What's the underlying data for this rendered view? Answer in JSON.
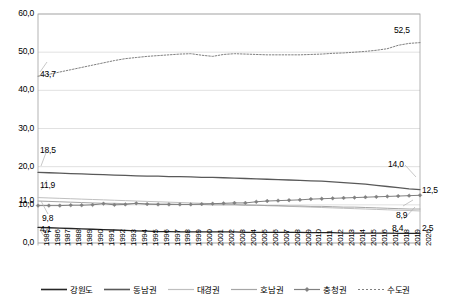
{
  "chart_data": {
    "type": "line",
    "title": "",
    "xlabel": "",
    "ylabel": "",
    "ylim": [
      0.0,
      60.0
    ],
    "yticks": [
      "0,0",
      "10,0",
      "20,0",
      "30,0",
      "40,0",
      "50,0",
      "60,0"
    ],
    "ytick_values": [
      0.0,
      10.0,
      20.0,
      30.0,
      40.0,
      50.0,
      60.0
    ],
    "extra_ytick": {
      "label": "11,0",
      "value": 11.0
    },
    "grid": "horizontal",
    "legend_position": "bottom",
    "x": [
      1985,
      1986,
      1987,
      1988,
      1989,
      1990,
      1991,
      1992,
      1993,
      1994,
      1995,
      1996,
      1997,
      1998,
      1999,
      2000,
      2001,
      2002,
      2003,
      2004,
      2005,
      2006,
      2007,
      2008,
      2009,
      2010,
      2011,
      2012,
      2013,
      2014,
      2015,
      2016,
      2017,
      2018,
      2019,
      2020
    ],
    "categories": [
      "1985",
      "1986",
      "1987",
      "1988",
      "1989",
      "1990",
      "1991",
      "1992",
      "1993",
      "1994",
      "1995",
      "1996",
      "1997",
      "1998",
      "1999",
      "2000",
      "2001",
      "2002",
      "2003",
      "2004",
      "2005",
      "2006",
      "2007",
      "2008",
      "2009",
      "2010",
      "2011",
      "2012",
      "2013",
      "2014",
      "2015",
      "2016",
      "2017",
      "2018",
      "2019",
      "2020"
    ],
    "series": [
      {
        "name": "수도권",
        "color": "#808080",
        "style": "dotted",
        "width": 1.0,
        "marker": "none",
        "values": [
          43.7,
          44.2,
          44.8,
          45.4,
          46.0,
          46.6,
          47.2,
          47.8,
          48.3,
          48.6,
          48.9,
          49.1,
          49.3,
          49.5,
          49.6,
          49.2,
          48.9,
          49.4,
          49.6,
          49.5,
          49.4,
          49.3,
          49.3,
          49.3,
          49.3,
          49.4,
          49.5,
          49.7,
          49.8,
          50.0,
          50.2,
          50.5,
          50.9,
          51.8,
          52.3,
          52.5
        ],
        "start_label": "43,7",
        "end_label": "52,5"
      },
      {
        "name": "동남권",
        "color": "#595959",
        "style": "solid",
        "width": 1.3,
        "marker": "none",
        "values": [
          18.5,
          18.4,
          18.3,
          18.2,
          18.1,
          18.0,
          17.9,
          17.8,
          17.7,
          17.6,
          17.5,
          17.5,
          17.4,
          17.4,
          17.3,
          17.2,
          17.2,
          17.1,
          17.0,
          16.9,
          16.8,
          16.7,
          16.6,
          16.5,
          16.4,
          16.3,
          16.2,
          16.0,
          15.8,
          15.6,
          15.4,
          15.1,
          14.8,
          14.5,
          14.2,
          14.0
        ],
        "start_label": "18,5",
        "end_label": "14,0"
      },
      {
        "name": "대경권",
        "color": "#bfbfbf",
        "style": "solid",
        "width": 1.0,
        "marker": "none",
        "values": [
          11.9,
          11.8,
          11.7,
          11.6,
          11.5,
          11.4,
          11.3,
          11.2,
          11.1,
          11.0,
          10.9,
          10.8,
          10.7,
          10.6,
          10.5,
          10.4,
          10.3,
          10.2,
          10.1,
          10.0,
          9.9,
          9.8,
          9.7,
          9.6,
          9.5,
          9.4,
          9.3,
          9.2,
          9.1,
          9.0,
          8.9,
          8.8,
          8.7,
          8.6,
          8.5,
          8.4
        ],
        "start_label": "11,9",
        "end_label": "8,4"
      },
      {
        "name": "호남권",
        "color": "#a6a6a6",
        "style": "solid",
        "width": 1.0,
        "marker": "none",
        "values": [
          11.0,
          10.9,
          10.8,
          10.7,
          10.6,
          10.5,
          10.4,
          10.4,
          10.3,
          10.3,
          10.2,
          10.2,
          10.2,
          10.1,
          10.1,
          10.1,
          10.0,
          10.0,
          10.0,
          9.9,
          9.9,
          9.8,
          9.8,
          9.7,
          9.7,
          9.6,
          9.6,
          9.5,
          9.4,
          9.4,
          9.3,
          9.2,
          9.1,
          9.0,
          8.9,
          8.9
        ],
        "start_label": "11,0",
        "end_label": "8,9"
      },
      {
        "name": "충청권",
        "color": "#808080",
        "style": "solid",
        "width": 1.0,
        "marker": "diamond",
        "values": [
          9.8,
          9.8,
          9.8,
          9.9,
          9.9,
          10.0,
          10.3,
          10.0,
          10.1,
          10.4,
          10.2,
          10.1,
          10.1,
          10.1,
          10.1,
          10.2,
          10.3,
          10.4,
          10.5,
          10.5,
          10.8,
          11.0,
          11.1,
          11.2,
          11.3,
          11.5,
          11.6,
          11.7,
          11.8,
          11.9,
          12.0,
          12.1,
          12.2,
          12.3,
          12.4,
          12.5
        ],
        "start_label": "9,8",
        "end_label": "12,5"
      },
      {
        "name": "강원도",
        "color": "#262626",
        "style": "solid",
        "width": 1.3,
        "marker": "none",
        "values": [
          4.1,
          4.0,
          3.9,
          3.8,
          3.7,
          3.6,
          3.5,
          3.4,
          3.3,
          3.2,
          3.1,
          3.0,
          3.0,
          2.9,
          2.9,
          2.9,
          2.9,
          2.9,
          2.9,
          2.8,
          2.8,
          2.8,
          2.8,
          2.8,
          2.8,
          2.7,
          2.7,
          2.7,
          2.6,
          2.6,
          2.6,
          2.6,
          2.6,
          2.5,
          2.5,
          2.5
        ],
        "start_label": "4,1",
        "end_label": "2,5"
      }
    ],
    "data_labels": {
      "left": [
        "43,7",
        "18,5",
        "11,9",
        "9,8",
        "4,1"
      ],
      "right": [
        "52,5",
        "14,0",
        "12,5",
        "8,9",
        "8,4",
        "2,5"
      ]
    }
  },
  "legend": {
    "items": [
      {
        "label": "강원도",
        "color": "#262626",
        "marker": "none",
        "width": 1.6
      },
      {
        "label": "동남권",
        "color": "#595959",
        "marker": "none",
        "width": 1.6
      },
      {
        "label": "대경권",
        "color": "#bfbfbf",
        "marker": "none",
        "width": 1.2
      },
      {
        "label": "호남권",
        "color": "#a6a6a6",
        "marker": "none",
        "width": 1.2
      },
      {
        "label": "충청권",
        "color": "#808080",
        "marker": "diamond",
        "width": 1.2
      },
      {
        "label": "수도권",
        "color": "#808080",
        "marker": "none",
        "width": 1.0,
        "dash": "2 2"
      }
    ]
  },
  "colors": {
    "axis": "#a0a0a0",
    "grid": "#d9d9d9",
    "text": "#000000",
    "background": "#ffffff"
  }
}
